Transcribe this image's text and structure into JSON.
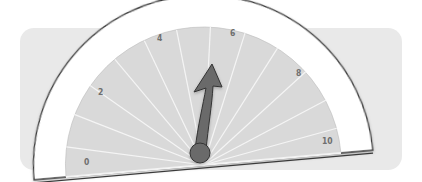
{
  "gauge": {
    "min": 0,
    "max": 10,
    "value": 5.3,
    "tick_labels": [
      "0",
      "2",
      "4",
      "6",
      "8",
      "10"
    ],
    "colors": {
      "panel": "#e9e9e9",
      "dial_band": "#ffffff",
      "dial_face": "#d9d9d9",
      "outline": "#3a3a3a",
      "needle": "#6b6b6b",
      "rays": "#f4f4f4",
      "labels": "#6f6f6f"
    }
  }
}
